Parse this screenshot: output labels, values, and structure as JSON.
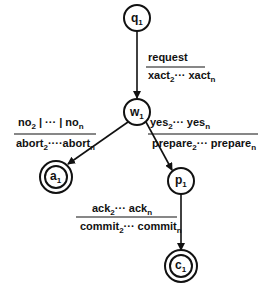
{
  "diagram": {
    "type": "state-machine",
    "nodes": [
      {
        "id": "q1",
        "label": "q",
        "sub": "1",
        "final": false
      },
      {
        "id": "w1",
        "label": "w",
        "sub": "1",
        "final": false
      },
      {
        "id": "a1",
        "label": "a",
        "sub": "1",
        "final": true
      },
      {
        "id": "p1",
        "label": "p",
        "sub": "1",
        "final": false
      },
      {
        "id": "c1",
        "label": "c",
        "sub": "1",
        "final": true
      }
    ],
    "edges": [
      {
        "from": "q1",
        "to": "w1",
        "input": "request",
        "output": "xact2 ··· xactn"
      },
      {
        "from": "w1",
        "to": "a1",
        "input": "no2 | ··· | non",
        "output": "abort2 ··· abortn"
      },
      {
        "from": "w1",
        "to": "p1",
        "input": "yes2 ··· yesn",
        "output": "prepare2 ··· preparen"
      },
      {
        "from": "p1",
        "to": "c1",
        "input": "ack2 ··· ackn",
        "output": "commit2 ··· commitn"
      }
    ]
  },
  "labels": {
    "q1": {
      "main": "q",
      "sub": "1"
    },
    "w1": {
      "main": "w",
      "sub": "1"
    },
    "a1": {
      "main": "a",
      "sub": "1"
    },
    "p1": {
      "main": "p",
      "sub": "1"
    },
    "c1": {
      "main": "c",
      "sub": "1"
    },
    "e1_in": "request",
    "e1_out_a": "xact",
    "e1_out_a_sub": "2",
    "e1_dots": "···",
    "e1_out_b": "xact",
    "e1_out_b_sub": "n",
    "e2_in_a": "no",
    "e2_in_a_sub": "2",
    "e2_in_mid": " | ··· | ",
    "e2_in_b": "no",
    "e2_in_b_sub": "n",
    "e2_out_a": "abort",
    "e2_out_a_sub": "2",
    "e2_dots": "····",
    "e2_out_b": "abort",
    "e2_out_b_sub": "n",
    "e3_in_a": "yes",
    "e3_in_a_sub": "2",
    "e3_dots": "···",
    "e3_in_b": "yes",
    "e3_in_b_sub": "n",
    "e3_out_a": "prepare",
    "e3_out_a_sub": "2",
    "e3_out_dots": "···",
    "e3_out_b": "prepare",
    "e3_out_b_sub": "n",
    "e4_in_a": "ack",
    "e4_in_a_sub": "2",
    "e4_dots": "···",
    "e4_in_b": "ack",
    "e4_in_b_sub": "n",
    "e4_out_a": "commit",
    "e4_out_a_sub": "2",
    "e4_out_dots": "···",
    "e4_out_b": "commit",
    "e4_out_b_sub": "n"
  }
}
